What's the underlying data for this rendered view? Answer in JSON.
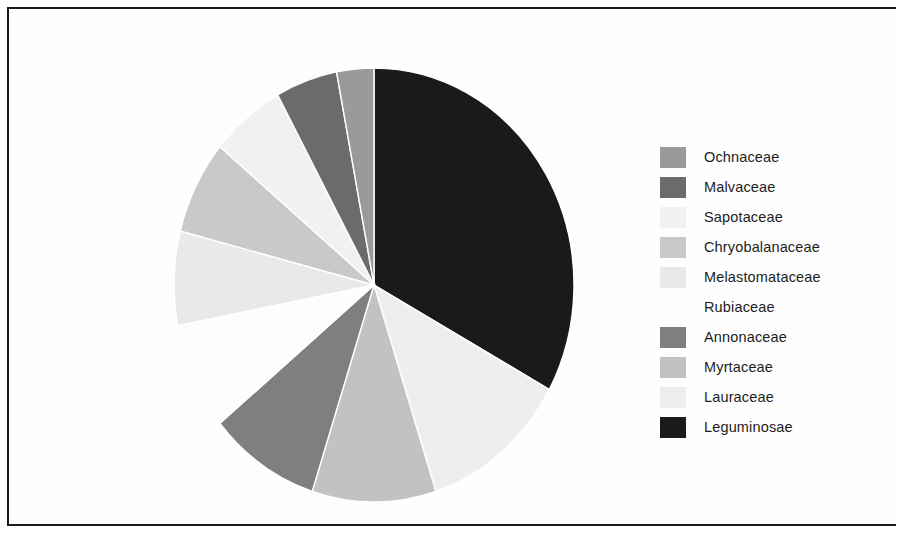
{
  "figure": {
    "background_color": "#ffffff",
    "frame_color": "#1b1b1b",
    "text_color": "#1d1d1d"
  },
  "legend": {
    "position": "right",
    "items": [
      {
        "label": "Ochnaceae",
        "color": "#9a9a9a"
      },
      {
        "label": "Malvaceae",
        "color": "#6b6b6b"
      },
      {
        "label": "Sapotaceae",
        "color": "#f1f1f1"
      },
      {
        "label": "Chryobalanaceae",
        "color": "#c9c9c9"
      },
      {
        "label": "Melastomataceae",
        "color": "#e9e9e9"
      },
      {
        "label": "Rubiaceae",
        "color": "#fdfdfd"
      },
      {
        "label": "Annonaceae",
        "color": "#7f7f7f"
      },
      {
        "label": "Myrtaceae",
        "color": "#c2c2c2"
      },
      {
        "label": "Lauraceae",
        "color": "#eeeeee"
      },
      {
        "label": "Leguminosae",
        "color": "#1a1a1a"
      }
    ]
  },
  "chart_data": {
    "type": "pie",
    "title": "",
    "subtitle": "",
    "xlabel": "",
    "ylabel": "",
    "grid": false,
    "legend_position": "right",
    "start_angle_deg": 0,
    "direction": "clockwise",
    "categories": [
      "Leguminosae",
      "Lauraceae",
      "Myrtaceae",
      "Annonaceae",
      "Rubiaceae",
      "Melastomataceae",
      "Chryobalanaceae",
      "Sapotaceae",
      "Malvaceae",
      "Ochnaceae"
    ],
    "values": [
      33,
      12,
      10,
      9,
      8,
      7,
      7,
      6,
      5,
      3
    ],
    "units": "percent",
    "colors": [
      "#1a1a1a",
      "#eeeeee",
      "#c2c2c2",
      "#7f7f7f",
      "#fdfdfd",
      "#e9e9e9",
      "#c9c9c9",
      "#f1f1f1",
      "#6b6b6b",
      "#9a9a9a"
    ],
    "slice_edge_color": "#ffffff",
    "annotations": []
  }
}
